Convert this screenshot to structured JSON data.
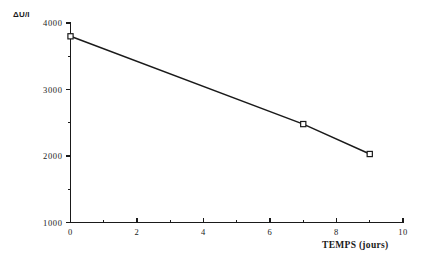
{
  "chart_data": {
    "type": "line",
    "title": "",
    "subtitle": "",
    "xlabel": "TEMPS  (jours)",
    "ylabel": "ΔU/I",
    "xlim": [
      0,
      10
    ],
    "ylim": [
      1000,
      4000
    ],
    "grid": false,
    "legend": null,
    "x": [
      0,
      7,
      9
    ],
    "values": [
      3800,
      2480,
      2030
    ],
    "series": [
      {
        "name": "ΔU/I",
        "x": [
          0,
          7,
          9
        ],
        "values": [
          3800,
          2480,
          2030
        ],
        "marker": "square",
        "color": "#1a1a1a"
      }
    ],
    "x_ticks_major": [
      0,
      2,
      4,
      6,
      8,
      10
    ],
    "x_tick_labels": [
      "0",
      "2",
      "4",
      "6",
      "8",
      "10"
    ],
    "x_ticks_minor": [
      1,
      3,
      5,
      7,
      9
    ],
    "y_ticks_major": [
      1000,
      2000,
      3000,
      4000
    ],
    "y_tick_labels": [
      "1000",
      "2000",
      "3000",
      "4000"
    ],
    "y_ticks_minor": [
      1500,
      2500,
      3500
    ],
    "annotations": []
  },
  "colors": {
    "background": "#ffffff",
    "axis": "#1a1a1a",
    "series": "#1a1a1a",
    "marker_fill": "#ffffff"
  }
}
